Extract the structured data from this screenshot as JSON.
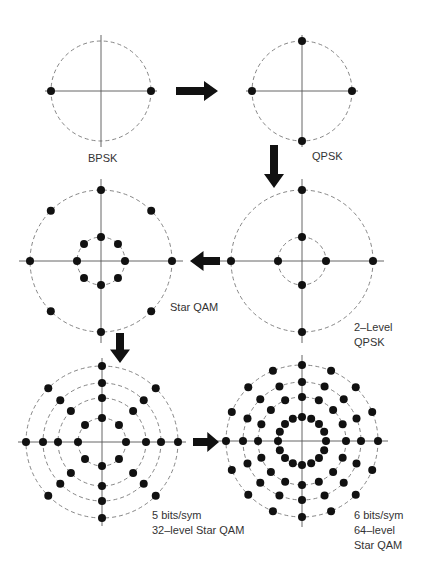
{
  "colors": {
    "point": "#111111",
    "axis": "#555555",
    "ring": "#777777",
    "arrow": "#111111",
    "text": "#333333"
  },
  "diagrams": [
    {
      "id": "bpsk",
      "label_lines": [
        "BPSK"
      ],
      "center": [
        101,
        91
      ],
      "axis_half": 56,
      "rings": [
        {
          "r": 50,
          "n": 2,
          "phase": 0,
          "dashed": true
        }
      ],
      "label_pos": [
        88,
        151
      ]
    },
    {
      "id": "qpsk",
      "label_lines": [
        "QPSK"
      ],
      "center": [
        302,
        91
      ],
      "axis_half": 56,
      "rings": [
        {
          "r": 50,
          "n": 4,
          "phase": 0,
          "dashed": true
        }
      ],
      "label_pos": [
        312,
        149
      ]
    },
    {
      "id": "star-qam",
      "label_lines": [
        "Star QAM"
      ],
      "center": [
        101,
        261
      ],
      "axis_half": 82,
      "rings": [
        {
          "r": 24,
          "n": 8,
          "phase": 0,
          "dashed": true
        },
        {
          "r": 71,
          "n": 8,
          "phase": 0,
          "dashed": true
        }
      ],
      "label_pos": [
        170,
        300
      ]
    },
    {
      "id": "two-level-qpsk",
      "label_lines": [
        "2–Level",
        "QPSK"
      ],
      "center": [
        302,
        261
      ],
      "axis_half": 82,
      "rings": [
        {
          "r": 24,
          "n": 4,
          "phase": 0,
          "dashed": true
        },
        {
          "r": 71,
          "n": 4,
          "phase": 0,
          "dashed": true
        }
      ],
      "label_pos": [
        354,
        320
      ]
    },
    {
      "id": "star-qam-32",
      "label_lines": [
        "5 bits/sym",
        "32–level Star QAM"
      ],
      "center": [
        102,
        442
      ],
      "axis_half": 84,
      "rings": [
        {
          "r": 24,
          "n": 8,
          "phase": 0,
          "dashed": true
        },
        {
          "r": 44,
          "n": 8,
          "phase": 0,
          "dashed": true
        },
        {
          "r": 59,
          "n": 8,
          "phase": 0,
          "dashed": true
        },
        {
          "r": 76,
          "n": 8,
          "phase": 0,
          "dashed": true
        }
      ],
      "label_pos": [
        152,
        508
      ]
    },
    {
      "id": "star-qam-64",
      "label_lines": [
        "6 bits/sym",
        "64–level",
        "Star QAM"
      ],
      "center": [
        302,
        441
      ],
      "axis_half": 86,
      "rings": [
        {
          "r": 24,
          "n": 16,
          "phase": 0,
          "dashed": true
        },
        {
          "r": 44,
          "n": 16,
          "phase": 0,
          "dashed": true
        },
        {
          "r": 59,
          "n": 16,
          "phase": 0,
          "dashed": true
        },
        {
          "r": 76,
          "n": 16,
          "phase": 0,
          "dashed": true
        }
      ],
      "label_pos": [
        354,
        508
      ]
    }
  ],
  "arrows": [
    {
      "id": "bpsk-to-qpsk",
      "direction": "right",
      "x": 176,
      "y": 91,
      "length": 42
    },
    {
      "id": "qpsk-to-2level",
      "direction": "down",
      "x": 274,
      "y": 145,
      "length": 43
    },
    {
      "id": "2level-to-starqam",
      "direction": "left",
      "x": 220,
      "y": 261,
      "length": 30
    },
    {
      "id": "starqam-to-32",
      "direction": "down",
      "x": 120,
      "y": 333,
      "length": 30
    },
    {
      "id": "32-to-64",
      "direction": "right",
      "x": 193,
      "y": 442,
      "length": 26
    }
  ]
}
